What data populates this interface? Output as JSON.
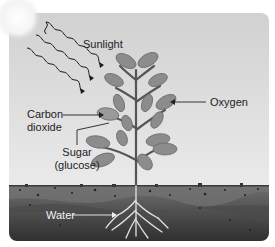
{
  "diagram": {
    "labels": {
      "sunlight": "Sunlight",
      "oxygen": "Oxygen",
      "carbon_line1": "Carbon",
      "carbon_line2": "dioxide",
      "sugar_line1": "Sugar",
      "sugar_line2": "(glucose)",
      "water": "Water"
    },
    "colors": {
      "sky_top": "#d6d6d6",
      "sky_bottom": "#f4f4f4",
      "leaf": "#8e8e8e",
      "leaf_light": "#a8a8a8",
      "stem": "#5a5a5a",
      "soil_top": "#6b6b6b",
      "soil_bottom": "#2e2e2e",
      "root": "#e6e6e6",
      "arrow": "#222222"
    }
  }
}
